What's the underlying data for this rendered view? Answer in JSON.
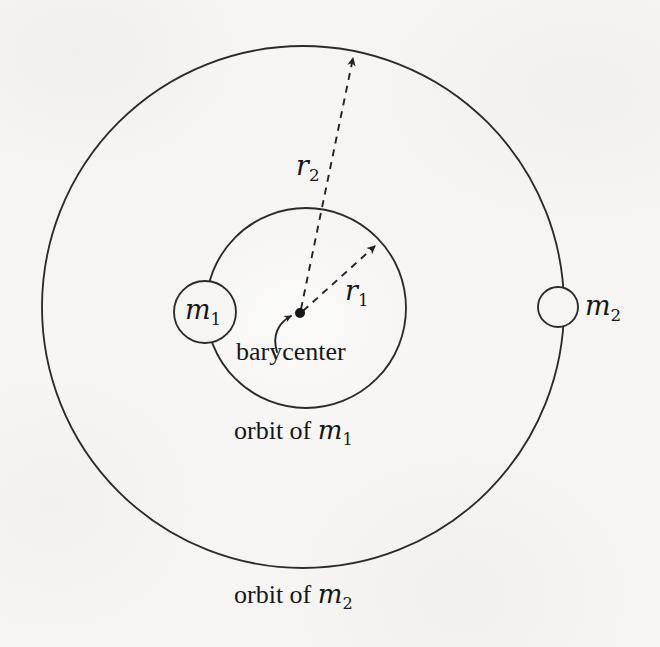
{
  "figure": {
    "kind": "two-body-barycenter-orbit-diagram",
    "background_color": "#f6f5f3",
    "stroke_color": "#2b2b2e",
    "text_color": "#17171a",
    "labels": {
      "mass_1": "m",
      "mass_1_sub": "1",
      "mass_2": "m",
      "mass_2_sub": "2",
      "radius_1": "r",
      "radius_1_sub": "1",
      "radius_2": "r",
      "radius_2_sub": "2",
      "barycenter": "barycenter",
      "orbit_of_m1_prefix": "orbit of ",
      "orbit_of_m1_symbol": "m",
      "orbit_of_m1_sub": "1",
      "orbit_of_m2_prefix": "orbit of ",
      "orbit_of_m2_symbol": "m",
      "orbit_of_m2_sub": "2"
    },
    "geometry": {
      "outer_orbit": {
        "cx": 303,
        "cy": 307,
        "r": 261
      },
      "inner_orbit": {
        "cx": 306,
        "cy": 308,
        "r": 100
      },
      "body_m1": {
        "cx": 205,
        "cy": 312,
        "r": 31
      },
      "body_m2": {
        "cx": 558,
        "cy": 307,
        "r": 20
      },
      "barycenter_point": {
        "cx": 300,
        "cy": 313,
        "r": 5
      },
      "arrow_r1": {
        "x1": 303,
        "y1": 311,
        "x2": 375,
        "y2": 246
      },
      "arrow_r2": {
        "x1": 301,
        "y1": 309,
        "x2": 353,
        "y2": 58
      },
      "callout_curve": {
        "from_x": 282,
        "from_y": 348,
        "to_x": 289,
        "to_y": 317
      }
    }
  }
}
